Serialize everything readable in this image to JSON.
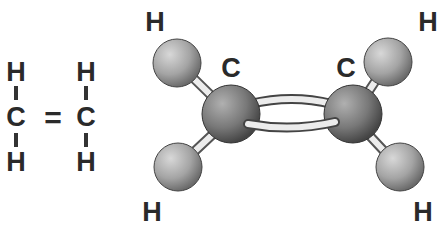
{
  "structural_formula": {
    "name": "ethylene-structural-formula",
    "atoms": [
      {
        "symbol": "H",
        "x": 16,
        "y": 72
      },
      {
        "symbol": "C",
        "x": 16,
        "y": 117
      },
      {
        "symbol": "H",
        "x": 16,
        "y": 162
      },
      {
        "symbol": "H",
        "x": 86,
        "y": 72
      },
      {
        "symbol": "C",
        "x": 86,
        "y": 117
      },
      {
        "symbol": "H",
        "x": 86,
        "y": 162
      }
    ],
    "double_bond_symbol": "="
  },
  "ball_and_stick": {
    "labels": [
      {
        "symbol": "H",
        "x": 155,
        "y": 22
      },
      {
        "symbol": "H",
        "x": 428,
        "y": 22
      },
      {
        "symbol": "C",
        "x": 231,
        "y": 68
      },
      {
        "symbol": "C",
        "x": 346,
        "y": 68
      },
      {
        "symbol": "H",
        "x": 152,
        "y": 212
      },
      {
        "symbol": "H",
        "x": 423,
        "y": 212
      }
    ],
    "atom_colors": {
      "carbon": "#7a7a7a",
      "hydrogen": "#a8a8a8",
      "bond": "#e8e8e8"
    }
  }
}
